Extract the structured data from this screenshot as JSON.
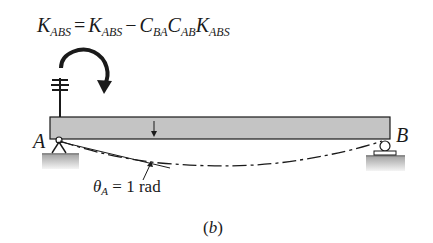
{
  "equation": {
    "lhs_symbol": "K",
    "lhs_sub": "ABS",
    "equals": "=",
    "term1_symbol": "K",
    "term1_sub": "ABS",
    "minus": "−",
    "c1_symbol": "C",
    "c1_sub": "BA",
    "c2_symbol": "C",
    "c2_sub": "AB",
    "k_symbol": "K",
    "k_sub": "ABS"
  },
  "labels": {
    "support_a": "A",
    "support_b": "B"
  },
  "rotation": {
    "theta_symbol": "θ",
    "theta_sub": "A",
    "value_text": "= 1 rad"
  },
  "caption": {
    "open": "(",
    "letter": "b",
    "close": ")"
  },
  "colors": {
    "beam_fill": "#c4c4c4",
    "ground_fill": "#b8b8b8",
    "line": "#1a1a1a"
  }
}
